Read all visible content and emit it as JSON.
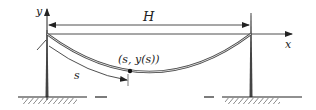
{
  "diagram": {
    "labels": {
      "y_axis": "y",
      "x_axis": "x",
      "span": "H",
      "arc_length": "s",
      "point": "(s, y(s))"
    },
    "colors": {
      "line": "#222222",
      "cable": "#555555",
      "background": "#ffffff"
    }
  }
}
